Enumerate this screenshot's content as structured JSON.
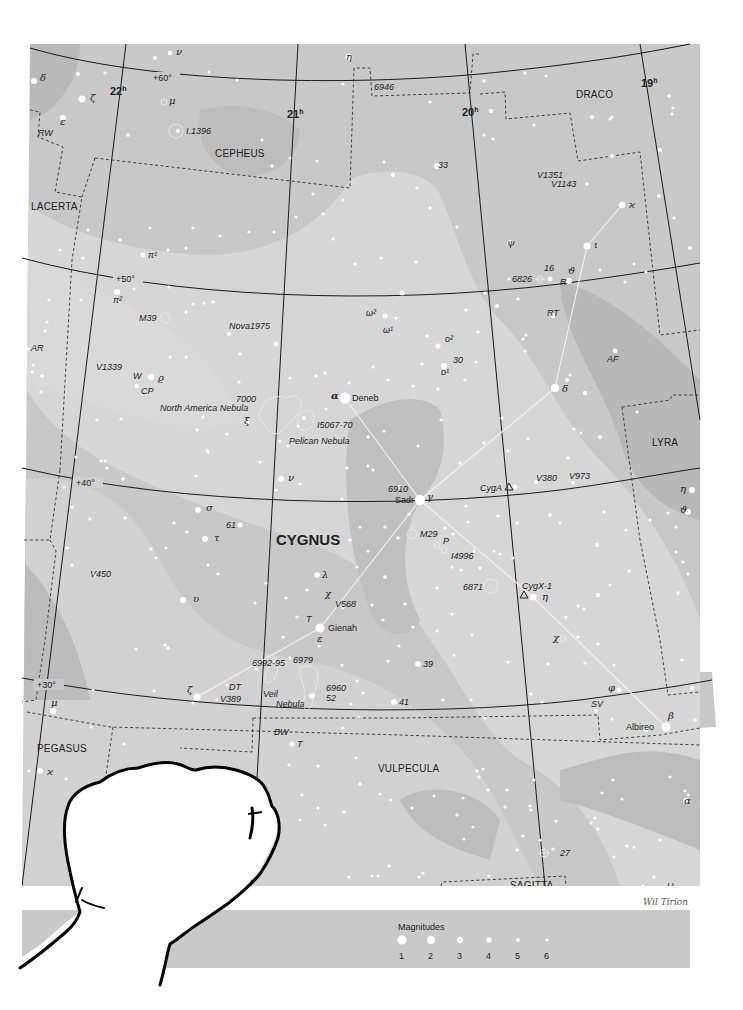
{
  "map": {
    "title": "CYGNUS",
    "credit": "Wil Tirion",
    "colors": {
      "background": "#ffffff",
      "sky_light": "#d4d4d4",
      "sky_mid": "#c6c6c6",
      "sky_dark": "#b3b3b3",
      "grid": "#1a1a1a",
      "boundary": "#333333",
      "star": "#ffffff",
      "figure_line": "#f2f2f2",
      "legend_bar": "#c9c9c9"
    },
    "constellations": [
      {
        "name": "CYGNUS",
        "x": 276,
        "y": 545,
        "primary": true
      },
      {
        "name": "CEPHEUS",
        "x": 215,
        "y": 157
      },
      {
        "name": "DRACO",
        "x": 576,
        "y": 98
      },
      {
        "name": "LACERTA",
        "x": 31,
        "y": 210
      },
      {
        "name": "LYRA",
        "x": 652,
        "y": 446
      },
      {
        "name": "PEGASUS",
        "x": 37,
        "y": 752
      },
      {
        "name": "VULPECULA",
        "x": 378,
        "y": 772
      },
      {
        "name": "SAGITTA",
        "x": 510,
        "y": 889
      }
    ],
    "hour_labels": [
      {
        "text": "22",
        "sup": "h",
        "x": 110,
        "y": 95
      },
      {
        "text": "21",
        "sup": "h",
        "x": 287,
        "y": 118
      },
      {
        "text": "20",
        "sup": "h",
        "x": 462,
        "y": 116
      },
      {
        "text": "19",
        "sup": "h",
        "x": 641,
        "y": 87
      }
    ],
    "dec_labels": [
      {
        "text": "+60°",
        "x": 153,
        "y": 80
      },
      {
        "text": "+50°",
        "x": 116,
        "y": 281
      },
      {
        "text": "+40°",
        "x": 76,
        "y": 485
      },
      {
        "text": "+30°",
        "x": 37,
        "y": 687
      }
    ],
    "named_stars": [
      {
        "name": "Deneb",
        "greek": "α",
        "x": 345,
        "y": 398
      },
      {
        "name": "Sadr",
        "greek": "γ",
        "x": 420,
        "y": 500
      },
      {
        "name": "Gienah",
        "greek": "ε",
        "x": 320,
        "y": 628
      },
      {
        "name": "Albireo",
        "greek": "β",
        "x": 666,
        "y": 727
      }
    ],
    "star_labels": [
      {
        "text": "δ",
        "x": 40,
        "y": 81,
        "greek": true
      },
      {
        "text": "ζ",
        "x": 90,
        "y": 101,
        "greek": true
      },
      {
        "text": "ε",
        "x": 60,
        "y": 125,
        "greek": true
      },
      {
        "text": "RW",
        "x": 38,
        "y": 136
      },
      {
        "text": "ν",
        "x": 176,
        "y": 55,
        "greek": true
      },
      {
        "text": "μ",
        "x": 169,
        "y": 104,
        "greek": true
      },
      {
        "text": "I.1396",
        "x": 186,
        "y": 134
      },
      {
        "text": "η",
        "x": 346,
        "y": 60,
        "greek": true
      },
      {
        "text": "6946",
        "x": 374,
        "y": 90
      },
      {
        "text": "33",
        "x": 438,
        "y": 168
      },
      {
        "text": "V1351",
        "x": 537,
        "y": 178
      },
      {
        "text": "V1143",
        "x": 551,
        "y": 187
      },
      {
        "text": "ϰ",
        "x": 629,
        "y": 208,
        "greek": true
      },
      {
        "text": "ψ",
        "x": 507,
        "y": 246,
        "greek": true
      },
      {
        "text": "ι",
        "x": 594,
        "y": 248,
        "greek": true
      },
      {
        "text": "6826",
        "x": 512,
        "y": 282
      },
      {
        "text": "16",
        "x": 544,
        "y": 271
      },
      {
        "text": "ϑ",
        "x": 568,
        "y": 274,
        "greek": true
      },
      {
        "text": "R",
        "x": 560,
        "y": 285
      },
      {
        "text": "π¹",
        "x": 148,
        "y": 258
      },
      {
        "text": "π²",
        "x": 113,
        "y": 303
      },
      {
        "text": "M39",
        "x": 139,
        "y": 321
      },
      {
        "text": "Nova1975",
        "x": 229,
        "y": 329
      },
      {
        "text": "ω²",
        "x": 366,
        "y": 316
      },
      {
        "text": "ω¹",
        "x": 383,
        "y": 333
      },
      {
        "text": "ο²",
        "x": 445,
        "y": 342
      },
      {
        "text": "30",
        "x": 453,
        "y": 363
      },
      {
        "text": "ο¹",
        "x": 441,
        "y": 375
      },
      {
        "text": "RT",
        "x": 547,
        "y": 316
      },
      {
        "text": "AF",
        "x": 607,
        "y": 362
      },
      {
        "text": "AR",
        "x": 31,
        "y": 351
      },
      {
        "text": "V1339",
        "x": 96,
        "y": 370
      },
      {
        "text": "W",
        "x": 133,
        "y": 379
      },
      {
        "text": "ϱ",
        "x": 158,
        "y": 381,
        "greek": true
      },
      {
        "text": "CP",
        "x": 141,
        "y": 394
      },
      {
        "text": "7000",
        "x": 236,
        "y": 402
      },
      {
        "text": "North America Nebula",
        "x": 160,
        "y": 411
      },
      {
        "text": "ξ",
        "x": 244,
        "y": 424,
        "greek": true
      },
      {
        "text": "I5067-70",
        "x": 317,
        "y": 428
      },
      {
        "text": "Pelican Nebula",
        "x": 289,
        "y": 444
      },
      {
        "text": "δ",
        "x": 562,
        "y": 392,
        "greek": true
      },
      {
        "text": "ν",
        "x": 288,
        "y": 481,
        "greek": true
      },
      {
        "text": "6910",
        "x": 388,
        "y": 492
      },
      {
        "text": "CygA",
        "x": 480,
        "y": 491
      },
      {
        "text": "V380",
        "x": 536,
        "y": 481
      },
      {
        "text": "V973",
        "x": 569,
        "y": 479
      },
      {
        "text": "η",
        "x": 680,
        "y": 492,
        "greek": true
      },
      {
        "text": "ϑ",
        "x": 680,
        "y": 513,
        "greek": true
      },
      {
        "text": "σ",
        "x": 206,
        "y": 511,
        "greek": true
      },
      {
        "text": "61",
        "x": 226,
        "y": 528
      },
      {
        "text": "τ",
        "x": 214,
        "y": 541,
        "greek": true
      },
      {
        "text": "M29",
        "x": 420,
        "y": 537
      },
      {
        "text": "P",
        "x": 443,
        "y": 544
      },
      {
        "text": "I4996",
        "x": 451,
        "y": 559
      },
      {
        "text": "V450",
        "x": 90,
        "y": 577
      },
      {
        "text": "λ",
        "x": 322,
        "y": 578,
        "greek": true
      },
      {
        "text": "6871",
        "x": 463,
        "y": 590
      },
      {
        "text": "CygX-1",
        "x": 522,
        "y": 589
      },
      {
        "text": "η",
        "x": 542,
        "y": 600,
        "greek": true
      },
      {
        "text": "υ",
        "x": 193,
        "y": 602,
        "greek": true
      },
      {
        "text": "χ",
        "x": 325,
        "y": 597,
        "greek": true
      },
      {
        "text": "V568",
        "x": 335,
        "y": 607
      },
      {
        "text": "T",
        "x": 306,
        "y": 622
      },
      {
        "text": "χ",
        "x": 553,
        "y": 641,
        "greek": true
      },
      {
        "text": "6992-95",
        "x": 252,
        "y": 666
      },
      {
        "text": "6979",
        "x": 293,
        "y": 663
      },
      {
        "text": "39",
        "x": 423,
        "y": 667
      },
      {
        "text": "DT",
        "x": 229,
        "y": 690
      },
      {
        "text": "ζ",
        "x": 187,
        "y": 693,
        "greek": true
      },
      {
        "text": "V389",
        "x": 220,
        "y": 702
      },
      {
        "text": "Veil",
        "x": 263,
        "y": 697
      },
      {
        "text": "Nebula",
        "x": 276,
        "y": 707
      },
      {
        "text": "6960",
        "x": 326,
        "y": 691
      },
      {
        "text": "52",
        "x": 326,
        "y": 701
      },
      {
        "text": "41",
        "x": 399,
        "y": 705
      },
      {
        "text": "φ",
        "x": 608,
        "y": 691,
        "greek": true
      },
      {
        "text": "SV",
        "x": 591,
        "y": 707
      },
      {
        "text": "μ",
        "x": 51,
        "y": 706,
        "greek": true
      },
      {
        "text": "BW",
        "x": 274,
        "y": 735
      },
      {
        "text": "T",
        "x": 297,
        "y": 747
      },
      {
        "text": "ϰ",
        "x": 47,
        "y": 775,
        "greek": true
      },
      {
        "text": "α",
        "x": 684,
        "y": 804,
        "greek": true
      },
      {
        "text": "27",
        "x": 560,
        "y": 856
      },
      {
        "text": "U",
        "x": 667,
        "y": 889
      }
    ],
    "legend": {
      "title": "Magnitudes",
      "items": [
        {
          "mag": "1",
          "r": 4.5
        },
        {
          "mag": "2",
          "r": 4
        },
        {
          "mag": "3",
          "r": 3.2
        },
        {
          "mag": "4",
          "r": 2.6
        },
        {
          "mag": "5",
          "r": 2
        },
        {
          "mag": "6",
          "r": 1.4
        }
      ]
    }
  }
}
